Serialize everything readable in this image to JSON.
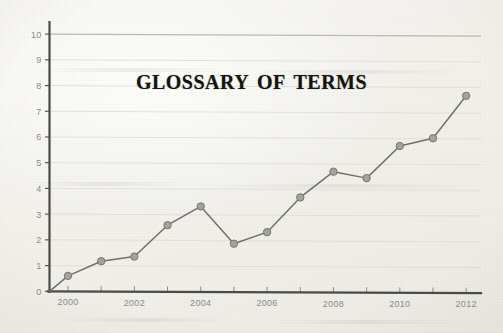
{
  "document": {
    "kind": "scanned-page",
    "page_background": "#f3f2ee"
  },
  "chart_data": {
    "type": "line",
    "title": "Glossary of Terms",
    "xlabel": "",
    "ylabel": "",
    "x": [
      2000,
      2001,
      2002,
      2003,
      2004,
      2005,
      2006,
      2007,
      2008,
      2009,
      2010,
      2011,
      2012
    ],
    "values": [
      0.6,
      1.17,
      1.35,
      2.57,
      3.3,
      1.85,
      2.3,
      3.65,
      4.65,
      4.4,
      5.65,
      5.95,
      7.6
    ],
    "series": [
      {
        "name": "series-1",
        "values": [
          0.6,
          1.17,
          1.35,
          2.57,
          3.3,
          1.85,
          2.3,
          3.65,
          4.65,
          4.4,
          5.65,
          5.95,
          7.6
        ]
      }
    ],
    "xlim": [
      1999.4,
      2012.4
    ],
    "ylim": [
      0,
      10
    ],
    "xticks": [
      2000,
      2001,
      2002,
      2003,
      2004,
      2005,
      2006,
      2007,
      2008,
      2009,
      2010,
      2011,
      2012
    ],
    "xtick_labels": [
      "2000",
      "",
      "2002",
      "",
      "2004",
      "",
      "2006",
      "",
      "2008",
      "",
      "2010",
      "",
      "2012"
    ],
    "yticks": [
      0,
      1,
      2,
      3,
      4,
      5,
      6,
      7,
      8,
      9,
      10
    ],
    "ytick_labels": [
      "0",
      "1",
      "2",
      "3",
      "4",
      "5",
      "6",
      "7",
      "8",
      "9",
      "10"
    ],
    "grid": true,
    "grid_axis": "y",
    "legend": false,
    "legend_position": "none",
    "marker": "circle",
    "line_color": "#6f6f6d",
    "marker_color": "#a3a39d",
    "marker_edge_color": "#77776f",
    "grid_color": "#dcdbd6",
    "axis_color": "#4a4a47",
    "tick_label_color": "#8b8b87",
    "title_color": "#15140f"
  }
}
